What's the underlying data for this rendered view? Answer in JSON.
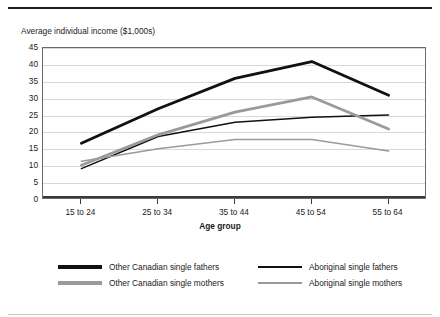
{
  "figure": {
    "clipped_header": "",
    "y_axis_title": "Average individual income ($1,000s)",
    "x_axis_title": "Age group"
  },
  "colors": {
    "dark": "#111111",
    "gray": "#9a9a9a",
    "grid": "#d9d9d9",
    "frame": "#6b6b6b"
  },
  "chart_data": {
    "type": "line",
    "title": "Average individual income ($1,000s)",
    "xlabel": "Age group",
    "ylabel": "Average individual income ($1,000s)",
    "categories": [
      "15 to 24",
      "25 to 34",
      "35 to 44",
      "45 to 54",
      "55 to 64"
    ],
    "ylim": [
      0,
      45
    ],
    "ytick_step": 5,
    "yticks": [
      0,
      5,
      10,
      15,
      20,
      25,
      30,
      35,
      40,
      45
    ],
    "grid": true,
    "legend_position": "bottom",
    "series": [
      {
        "name": "Other Canadian single fathers",
        "color": "#111111",
        "width": 2.8,
        "values": [
          16.8,
          27.0,
          36.0,
          41.0,
          31.0
        ]
      },
      {
        "name": "Aboriginal single fathers",
        "color": "#111111",
        "width": 1.5,
        "values": [
          9.3,
          18.8,
          23.0,
          24.5,
          25.2
        ]
      },
      {
        "name": "Other Canadian single mothers",
        "color": "#9a9a9a",
        "width": 2.8,
        "values": [
          10.3,
          19.3,
          26.0,
          30.5,
          21.0
        ]
      },
      {
        "name": "Aboriginal single mothers",
        "color": "#9a9a9a",
        "width": 1.5,
        "values": [
          11.5,
          15.2,
          17.9,
          17.9,
          14.5
        ]
      }
    ]
  },
  "legend": {
    "row1": [
      {
        "label": "Other Canadian single fathers",
        "color": "#111111",
        "thickness": 3.2
      },
      {
        "label": "Aboriginal single fathers",
        "color": "#111111",
        "thickness": 1.8
      }
    ],
    "row2": [
      {
        "label": "Other Canadian single mothers",
        "color": "#9a9a9a",
        "thickness": 3.2
      },
      {
        "label": "Aboriginal single mothers",
        "color": "#9a9a9a",
        "thickness": 1.8
      }
    ]
  }
}
